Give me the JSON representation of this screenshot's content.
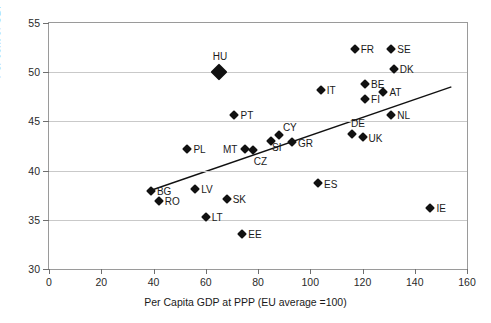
{
  "chart_data": {
    "type": "scatter",
    "title": "",
    "xlabel": "Per Capita GDP at PPP (EU average =100)",
    "ylabel": "Per cent of GDP",
    "xlim": [
      0,
      160
    ],
    "ylim": [
      30,
      55
    ],
    "xticks": [
      0,
      20,
      40,
      60,
      80,
      100,
      120,
      140,
      160
    ],
    "yticks": [
      30,
      35,
      40,
      45,
      50,
      55
    ],
    "grid": "horizontal",
    "legend": "none",
    "marker_color": "#111111",
    "trendline": {
      "type": "linear",
      "x_start": 38,
      "y_start": 37.9,
      "x_end": 154,
      "y_end": 48.5,
      "color": "#111111"
    },
    "points": [
      {
        "label": "FR",
        "x": 117,
        "y": 52.4,
        "label_dx": 6,
        "label_dy": 0,
        "size": "normal"
      },
      {
        "label": "SE",
        "x": 131,
        "y": 52.4,
        "label_dx": 6,
        "label_dy": 0,
        "size": "normal"
      },
      {
        "label": "DK",
        "x": 132,
        "y": 50.3,
        "label_dx": 6,
        "label_dy": 0,
        "size": "normal"
      },
      {
        "label": "HU",
        "x": 65,
        "y": 50.0,
        "label_dx": -6,
        "label_dy": -16,
        "size": "big"
      },
      {
        "label": "BE",
        "x": 121,
        "y": 48.8,
        "label_dx": 6,
        "label_dy": 0,
        "size": "normal"
      },
      {
        "label": "IT",
        "x": 104,
        "y": 48.2,
        "label_dx": 6,
        "label_dy": 0,
        "size": "normal"
      },
      {
        "label": "AT",
        "x": 128,
        "y": 48.0,
        "label_dx": 6,
        "label_dy": 0,
        "size": "normal"
      },
      {
        "label": "FI",
        "x": 121,
        "y": 47.3,
        "label_dx": 6,
        "label_dy": 0,
        "size": "normal"
      },
      {
        "label": "PT",
        "x": 71,
        "y": 45.6,
        "label_dx": 6,
        "label_dy": 0,
        "size": "normal"
      },
      {
        "label": "NL",
        "x": 131,
        "y": 45.6,
        "label_dx": 6,
        "label_dy": 0,
        "size": "normal"
      },
      {
        "label": "DE",
        "x": 116,
        "y": 43.7,
        "label_dx": -1,
        "label_dy": -11,
        "size": "normal"
      },
      {
        "label": "CY",
        "x": 88,
        "y": 43.6,
        "label_dx": 4,
        "label_dy": -8,
        "size": "normal"
      },
      {
        "label": "UK",
        "x": 120,
        "y": 43.4,
        "label_dx": 6,
        "label_dy": 1,
        "size": "normal"
      },
      {
        "label": "SI",
        "x": 85,
        "y": 43.0,
        "label_dx": 1,
        "label_dy": 6,
        "size": "normal"
      },
      {
        "label": "GR",
        "x": 93,
        "y": 42.9,
        "label_dx": 6,
        "label_dy": 1,
        "size": "normal"
      },
      {
        "label": "PL",
        "x": 53,
        "y": 42.2,
        "label_dx": 6,
        "label_dy": 0,
        "size": "normal"
      },
      {
        "label": "MT",
        "x": 75,
        "y": 42.2,
        "label_dx": -22,
        "label_dy": 0,
        "size": "normal"
      },
      {
        "label": "CZ",
        "x": 78,
        "y": 42.1,
        "label_dx": 1,
        "label_dy": 11,
        "size": "normal"
      },
      {
        "label": "ES",
        "x": 103,
        "y": 38.7,
        "label_dx": 6,
        "label_dy": 1,
        "size": "normal"
      },
      {
        "label": "LV",
        "x": 56,
        "y": 38.1,
        "label_dx": 6,
        "label_dy": 0,
        "size": "normal"
      },
      {
        "label": "BG",
        "x": 39,
        "y": 37.9,
        "label_dx": 6,
        "label_dy": 0,
        "size": "normal"
      },
      {
        "label": "SK",
        "x": 68,
        "y": 37.1,
        "label_dx": 6,
        "label_dy": 0,
        "size": "normal"
      },
      {
        "label": "RO",
        "x": 42,
        "y": 36.9,
        "label_dx": 6,
        "label_dy": 0,
        "size": "normal"
      },
      {
        "label": "IE",
        "x": 146,
        "y": 36.2,
        "label_dx": 6,
        "label_dy": 0,
        "size": "normal"
      },
      {
        "label": "LT",
        "x": 60,
        "y": 35.3,
        "label_dx": 6,
        "label_dy": 0,
        "size": "normal"
      },
      {
        "label": "EE",
        "x": 74,
        "y": 33.6,
        "label_dx": 6,
        "label_dy": 0,
        "size": "normal"
      }
    ]
  }
}
